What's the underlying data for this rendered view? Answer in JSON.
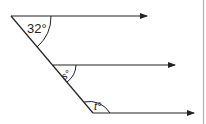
{
  "diagram": {
    "type": "parallel-lines-transversal",
    "angles": [
      {
        "id": "top",
        "label": "32°"
      },
      {
        "id": "middle",
        "label": "s°"
      },
      {
        "id": "bottom",
        "label": "t°"
      }
    ],
    "colors": {
      "line": "#222222",
      "border": "#b0b0b0"
    }
  }
}
